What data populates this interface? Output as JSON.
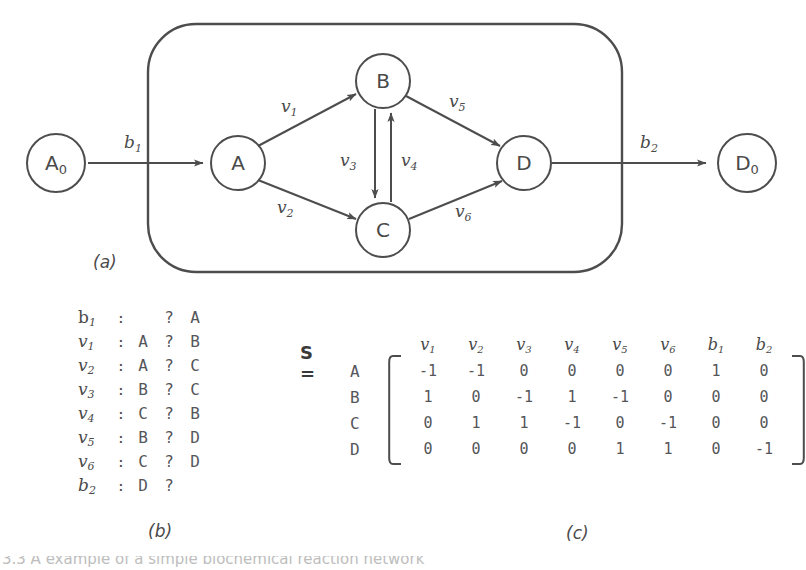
{
  "figure": {
    "panel_a_label": "(a)",
    "panel_b_label": "(b)",
    "panel_c_label": "(c)",
    "bottom_caption": "3.3  A example of a simple biochemical reaction network"
  },
  "diagram": {
    "type": "reaction-network",
    "internal_nodes": [
      "A",
      "B",
      "C",
      "D"
    ],
    "external_nodes": [
      "A₀",
      "D₀"
    ],
    "node_labels": {
      "A0": "A",
      "A0_sub": "0",
      "A": "A",
      "B": "B",
      "C": "C",
      "D": "D",
      "D0": "D",
      "D0_sub": "0"
    },
    "edges": [
      {
        "name": "b",
        "sub": "1",
        "from": "A0",
        "to": "A",
        "italic": true
      },
      {
        "name": "v",
        "sub": "1",
        "from": "A",
        "to": "B",
        "italic": true
      },
      {
        "name": "v",
        "sub": "2",
        "from": "A",
        "to": "C",
        "italic": true
      },
      {
        "name": "v",
        "sub": "3",
        "from": "B",
        "to": "C",
        "italic": true
      },
      {
        "name": "v",
        "sub": "4",
        "from": "C",
        "to": "B",
        "italic": true
      },
      {
        "name": "v",
        "sub": "5",
        "from": "B",
        "to": "D",
        "italic": true
      },
      {
        "name": "v",
        "sub": "6",
        "from": "C",
        "to": "D",
        "italic": true
      },
      {
        "name": "b",
        "sub": "2",
        "from": "D",
        "to": "D0",
        "italic": true
      }
    ],
    "edge_label_text": {
      "b1": "b",
      "b1_sub": "1",
      "v1": "v",
      "v1_sub": "1",
      "v2": "v",
      "v2_sub": "2",
      "v3": "v",
      "v3_sub": "3",
      "v4": "v",
      "v4_sub": "4",
      "v5": "v",
      "v5_sub": "5",
      "v6": "v",
      "v6_sub": "6",
      "b2": "b",
      "b2_sub": "2"
    }
  },
  "reaction_list": {
    "rows": [
      {
        "name": "b",
        "sub": "1",
        "upright": true,
        "colon": ":",
        "left": "",
        "arrow": "?",
        "right": "A"
      },
      {
        "name": "v",
        "sub": "1",
        "upright": false,
        "colon": ":",
        "left": "A",
        "arrow": "?",
        "right": "B"
      },
      {
        "name": "v",
        "sub": "2",
        "upright": false,
        "colon": ":",
        "left": "A",
        "arrow": "?",
        "right": "C"
      },
      {
        "name": "v",
        "sub": "3",
        "upright": false,
        "colon": ":",
        "left": "B",
        "arrow": "?",
        "right": "C"
      },
      {
        "name": "v",
        "sub": "4",
        "upright": false,
        "colon": ":",
        "left": "C",
        "arrow": "?",
        "right": "B"
      },
      {
        "name": "v",
        "sub": "5",
        "upright": false,
        "colon": ":",
        "left": "B",
        "arrow": "?",
        "right": "D"
      },
      {
        "name": "v",
        "sub": "6",
        "upright": false,
        "colon": ":",
        "left": "C",
        "arrow": "?",
        "right": "D"
      },
      {
        "name": "b",
        "sub": "2",
        "upright": false,
        "colon": ":",
        "left": "D",
        "arrow": "?",
        "right": ""
      }
    ]
  },
  "matrix": {
    "title": "S =",
    "col_headers": [
      {
        "base": "v",
        "sub": "1"
      },
      {
        "base": "v",
        "sub": "2"
      },
      {
        "base": "v",
        "sub": "3"
      },
      {
        "base": "v",
        "sub": "4"
      },
      {
        "base": "v",
        "sub": "5"
      },
      {
        "base": "v",
        "sub": "6"
      },
      {
        "base": "b",
        "sub": "1"
      },
      {
        "base": "b",
        "sub": "2"
      }
    ],
    "row_headers": [
      "A",
      "B",
      "C",
      "D"
    ],
    "values": [
      [
        "-1",
        "-1",
        "0",
        "0",
        "0",
        "0",
        "1",
        "0"
      ],
      [
        "1",
        "0",
        "-1",
        "1",
        "-1",
        "0",
        "0",
        "0"
      ],
      [
        "0",
        "1",
        "1",
        "-1",
        "0",
        "-1",
        "0",
        "0"
      ],
      [
        "0",
        "0",
        "0",
        "0",
        "1",
        "1",
        "0",
        "-1"
      ]
    ]
  },
  "chart_data": {
    "type": "diagram",
    "nodes": [
      "A0",
      "A",
      "B",
      "C",
      "D",
      "D0"
    ],
    "edges": [
      "b1: A0->A",
      "v1: A->B",
      "v2: A->C",
      "v3: B->C",
      "v4: C->B",
      "v5: B->D",
      "v6: C->D",
      "b2: D->D0"
    ],
    "matrix_rows": [
      "A",
      "B",
      "C",
      "D"
    ],
    "matrix_cols": [
      "v1",
      "v2",
      "v3",
      "v4",
      "v5",
      "v6",
      "b1",
      "b2"
    ],
    "matrix_values": [
      [
        -1,
        -1,
        0,
        0,
        0,
        0,
        1,
        0
      ],
      [
        1,
        0,
        -1,
        1,
        -1,
        0,
        0,
        0
      ],
      [
        0,
        1,
        1,
        -1,
        0,
        -1,
        0,
        0
      ],
      [
        0,
        0,
        0,
        0,
        1,
        1,
        0,
        -1
      ]
    ]
  },
  "colors": {
    "ink": "#4a4a4a",
    "stroke": "#5a5a5a",
    "background": "#ffffff"
  }
}
